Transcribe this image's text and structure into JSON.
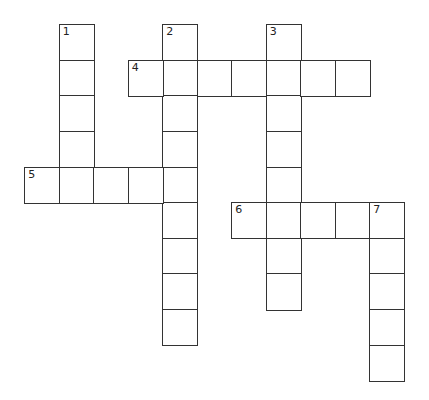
{
  "puzzle": {
    "type": "crossword",
    "origin_x": 25,
    "origin_y": 25,
    "cell_w": 34.5,
    "cell_h": 35.6,
    "line_color": "#333333",
    "words": [
      {
        "number": "1",
        "direction": "down",
        "row": 0,
        "col": 1,
        "length": 5
      },
      {
        "number": "2",
        "direction": "down",
        "row": 0,
        "col": 4,
        "length": 9
      },
      {
        "number": "3",
        "direction": "down",
        "row": 0,
        "col": 7,
        "length": 8
      },
      {
        "number": "4",
        "direction": "across",
        "row": 1,
        "col": 3,
        "length": 7
      },
      {
        "number": "5",
        "direction": "across",
        "row": 4,
        "col": 0,
        "length": 5
      },
      {
        "number": "6",
        "direction": "across",
        "row": 5,
        "col": 6,
        "length": 5
      },
      {
        "number": "7",
        "direction": "down",
        "row": 5,
        "col": 10,
        "length": 5
      }
    ]
  }
}
